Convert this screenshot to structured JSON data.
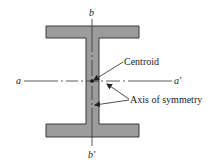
{
  "diagram": {
    "colors": {
      "fill": "#9c9c9c",
      "outline": "#3a3a3a",
      "axis": "#333333",
      "text": "#222222",
      "background": "#ffffff"
    },
    "shape": {
      "top_flange": {
        "x": 46,
        "y": 26,
        "w": 93,
        "h": 12
      },
      "web": {
        "x": 86,
        "y": 38,
        "w": 13,
        "h": 86
      },
      "bottom_flange": {
        "x": 46,
        "y": 124,
        "w": 93,
        "h": 13
      }
    },
    "axes": {
      "horizontal": {
        "start_label": "a",
        "end_label": "a'",
        "y": 81,
        "x1": 24,
        "x2": 172
      },
      "vertical": {
        "start_label": "b",
        "end_label": "b'",
        "x": 92,
        "y1": 19,
        "y2": 146
      }
    },
    "centroid": {
      "x": 92,
      "y": 81
    },
    "annotations": [
      {
        "text": "Centroid",
        "x": 124,
        "y": 65,
        "arrows": [
          {
            "from": [
              123,
              62
            ],
            "to": [
              94,
              80
            ]
          }
        ]
      },
      {
        "text": "Axis of symmetry",
        "x": 130,
        "y": 103,
        "arrows": [
          {
            "from": [
              129,
              99
            ],
            "to": [
              107,
              84
            ]
          },
          {
            "from": [
              129,
              100
            ],
            "to": [
              95,
              105
            ]
          }
        ]
      }
    ]
  }
}
